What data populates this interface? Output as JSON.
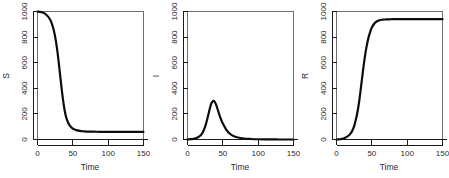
{
  "figure": {
    "background": "#ffffff",
    "line_color": "#0d0d0d",
    "axis_color": "#1a1a1a",
    "box_color": "#6f6f6f",
    "panel_count": 3
  },
  "chart_data": [
    {
      "type": "line",
      "title": "",
      "xlabel": "Time",
      "ylabel": "S",
      "xlim": [
        0,
        150
      ],
      "ylim": [
        0,
        1000
      ],
      "xticks": [
        0,
        50,
        100,
        150
      ],
      "yticks": [
        0,
        200,
        400,
        600,
        800,
        1000
      ],
      "xticklabels": [
        "0",
        "50",
        "100",
        "150"
      ],
      "yticklabels": [
        "0",
        "200",
        "400",
        "600",
        "800",
        "1000"
      ],
      "grid": false,
      "legend": false,
      "x": [
        0,
        5,
        10,
        15,
        18,
        20,
        22,
        24,
        26,
        28,
        30,
        32,
        34,
        36,
        38,
        40,
        42,
        45,
        50,
        55,
        60,
        65,
        70,
        80,
        90,
        100,
        110,
        120,
        130,
        140,
        150
      ],
      "y": [
        999,
        995,
        985,
        960,
        935,
        910,
        875,
        830,
        770,
        695,
        605,
        505,
        405,
        315,
        240,
        185,
        150,
        115,
        85,
        73,
        67,
        64,
        62,
        61,
        60,
        60,
        60,
        60,
        60,
        60,
        60
      ],
      "series": [
        {
          "name": "S",
          "values": [
            999,
            995,
            985,
            960,
            935,
            910,
            875,
            830,
            770,
            695,
            605,
            505,
            405,
            315,
            240,
            185,
            150,
            115,
            85,
            73,
            67,
            64,
            62,
            61,
            60,
            60,
            60,
            60,
            60,
            60,
            60
          ]
        }
      ],
      "baseline": 0,
      "notes": "Susceptible population declines sigmoidally from 1000 to an endemic floor near 60"
    },
    {
      "type": "line",
      "title": "",
      "xlabel": "Time",
      "ylabel": "I",
      "xlim": [
        0,
        150
      ],
      "ylim": [
        0,
        1000
      ],
      "xticks": [
        0,
        50,
        100,
        150
      ],
      "yticks": [
        0,
        200,
        400,
        600,
        800,
        1000
      ],
      "xticklabels": [
        "0",
        "50",
        "100",
        "150"
      ],
      "yticklabels": [
        "0",
        "200",
        "400",
        "600",
        "800",
        "1000"
      ],
      "grid": false,
      "legend": false,
      "x": [
        0,
        5,
        10,
        15,
        18,
        20,
        22,
        25,
        28,
        30,
        32,
        34,
        36,
        37,
        38,
        40,
        42,
        45,
        48,
        50,
        55,
        60,
        65,
        70,
        80,
        90,
        100,
        110,
        120,
        130,
        140,
        150
      ],
      "y": [
        1,
        3,
        7,
        18,
        30,
        42,
        60,
        100,
        160,
        205,
        250,
        285,
        300,
        302,
        298,
        278,
        248,
        195,
        150,
        125,
        75,
        45,
        28,
        18,
        8,
        4,
        2,
        1,
        1,
        0,
        0,
        0
      ],
      "series": [
        {
          "name": "I",
          "values": [
            1,
            3,
            7,
            18,
            30,
            42,
            60,
            100,
            160,
            205,
            250,
            285,
            300,
            302,
            298,
            278,
            248,
            195,
            150,
            125,
            75,
            45,
            28,
            18,
            8,
            4,
            2,
            1,
            1,
            0,
            0,
            0
          ]
        }
      ],
      "baseline": 0,
      "peak_value": 302,
      "peak_time": 37,
      "notes": "Infected epidemic curve peaking near 300 around time 37 then decaying toward zero"
    },
    {
      "type": "line",
      "title": "",
      "xlabel": "Time",
      "ylabel": "R",
      "xlim": [
        0,
        150
      ],
      "ylim": [
        0,
        1000
      ],
      "xticks": [
        0,
        50,
        100,
        150
      ],
      "yticks": [
        0,
        200,
        400,
        600,
        800,
        1000
      ],
      "xticklabels": [
        "0",
        "50",
        "100",
        "150"
      ],
      "yticklabels": [
        "0",
        "200",
        "400",
        "600",
        "800",
        "1000"
      ],
      "grid": false,
      "legend": false,
      "x": [
        0,
        5,
        10,
        15,
        18,
        20,
        22,
        25,
        28,
        30,
        32,
        34,
        36,
        38,
        40,
        42,
        45,
        48,
        50,
        55,
        60,
        65,
        70,
        75,
        80,
        90,
        100,
        110,
        120,
        130,
        140,
        150
      ],
      "y": [
        0,
        2,
        8,
        22,
        35,
        48,
        65,
        105,
        170,
        225,
        295,
        380,
        470,
        560,
        640,
        710,
        790,
        845,
        875,
        915,
        930,
        936,
        938,
        939,
        940,
        940,
        940,
        940,
        940,
        940,
        940,
        940
      ],
      "series": [
        {
          "name": "R",
          "values": [
            0,
            2,
            8,
            22,
            35,
            48,
            65,
            105,
            170,
            225,
            295,
            380,
            470,
            560,
            640,
            710,
            790,
            845,
            875,
            915,
            930,
            936,
            938,
            939,
            940,
            940,
            940,
            940,
            940,
            940,
            940,
            940
          ]
        }
      ],
      "baseline": 0,
      "notes": "Recovered population rises sigmoidally to a plateau near 940"
    }
  ]
}
